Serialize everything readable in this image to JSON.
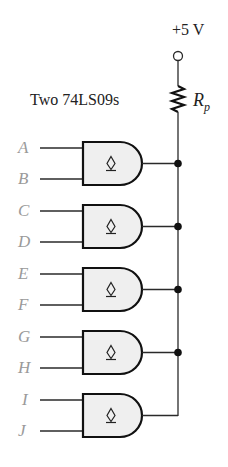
{
  "diagram": {
    "type": "wired-AND open-collector circuit",
    "supply_label": "+5 V",
    "ic_label": "Two 74LS09s",
    "resistor": {
      "label_main": "R",
      "label_sub": "p"
    },
    "gate_symbol": "open-collector",
    "gates": [
      {
        "inputs": [
          "A",
          "B"
        ],
        "junction": true
      },
      {
        "inputs": [
          "C",
          "D"
        ],
        "junction": true
      },
      {
        "inputs": [
          "E",
          "F"
        ],
        "junction": true
      },
      {
        "inputs": [
          "G",
          "H"
        ],
        "junction": true
      },
      {
        "inputs": [
          "I",
          "J"
        ],
        "junction": false
      }
    ]
  },
  "colors": {
    "wire": "#2a2a2a",
    "gate_fill": "#efefef",
    "gate_stroke": "#111111",
    "input_label": "#9a9a9a",
    "text": "#222222"
  }
}
